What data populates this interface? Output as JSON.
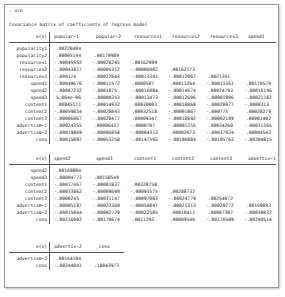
{
  "console": {
    "command": ". vce",
    "title": "Covariance matrix of coefficients of regress model"
  },
  "blocks": [
    {
      "corner": "e(V)",
      "columns": [
        "popular~1",
        "popular~2",
        "resources1",
        "resources2",
        "resources3",
        "spend1"
      ],
      "rows": [
        {
          "label": "popularity1",
          "values": [
            ".00220484",
            "",
            "",
            "",
            "",
            ""
          ]
        },
        {
          "label": "popularity2",
          "values": [
            ".00005144",
            ".00170989",
            "",
            "",
            "",
            ""
          ]
        },
        {
          "label": "resources1",
          "values": [
            "-.00045552",
            "-.00028245",
            ".00162999",
            "",
            "",
            ""
          ]
        },
        {
          "label": "resources2",
          "values": [
            "-.00043817",
            "-.00005312",
            "-.00006082",
            ".00162173",
            "",
            ""
          ]
        },
        {
          "label": "resources3",
          "values": [
            "-.000174",
            "-.00022643",
            "-.00013341",
            "-.00012067",
            ".0021351",
            ""
          ]
        },
        {
          "label": "spend1",
          "values": [
            "-.00049676",
            "-.00011572",
            ".0000587",
            ".00013264",
            "-.00013361",
            ".00170579"
          ]
        },
        {
          "label": "spend2",
          "values": [
            "-.00007232",
            "-.0001875",
            "-.00016084",
            "-.00014674",
            ".00024793",
            "-.00016196"
          ]
        },
        {
          "label": "spend3",
          "values": [
            "5.064e-06",
            "-.00000353",
            "-.00013473",
            "-.00012606",
            "-.00001906",
            "-.00021782"
          ]
        },
        {
          "label": "content1",
          "values": [
            ".00045171",
            "-.00014932",
            ".00030003",
            "-.00018068",
            "-.00020977",
            "-.0000313"
          ]
        },
        {
          "label": "content2",
          "values": [
            "-.00059834",
            "-.00028043",
            ".00032518",
            "-.00001867",
            "-.000775",
            ".00028279"
          ]
        },
        {
          "label": "content3",
          "values": [
            "-.00006867",
            "-.00028477",
            ".00009347",
            "-.00018692",
            "-.00002109",
            ".00001402"
          ]
        },
        {
          "label": "advertism~1",
          "values": [
            "-.00024355",
            ".00006437",
            "-.0000707",
            "-.00001255",
            ".00034268",
            "-.00011365"
          ]
        },
        {
          "label": "advertism~2",
          "values": [
            "-.00019869",
            "-.00006858",
            "-.00004313",
            ".00002673",
            "-.00037924",
            ".00004543"
          ]
        },
        {
          "label": "_cons",
          "values": [
            "-.00015897",
            "-.00053258",
            "-.00147593",
            "-.00196884",
            "-.00195763",
            "-.00204815"
          ]
        }
      ]
    },
    {
      "corner": "e(V)",
      "columns": [
        "spend2",
        "spend3",
        "content1",
        "content2",
        "content3",
        "advertis~1"
      ],
      "rows": [
        {
          "label": "spend2",
          "values": [
            ".00169884",
            "",
            "",
            "",
            "",
            ""
          ]
        },
        {
          "label": "spend3",
          "values": [
            "-.00004773",
            ".00158549",
            "",
            "",
            "",
            ""
          ]
        },
        {
          "label": "content1",
          "values": [
            "-.00017467",
            "-.00001837",
            ".00328758",
            "",
            "",
            ""
          ]
        },
        {
          "label": "content2",
          "values": [
            "-.00033862",
            "-.00009699",
            "-.00093575",
            ".00288732",
            "",
            ""
          ]
        },
        {
          "label": "content3",
          "values": [
            "-.0000245",
            "-.00031147",
            "-.00097083",
            "-.00024779",
            ".00254072",
            ""
          ]
        },
        {
          "label": "advertism~1",
          "values": [
            "-.00005187",
            "-.00023369",
            "-.00054847",
            "-.00021313",
            "-.00028272",
            ".00169893"
          ]
        },
        {
          "label": "advertism~2",
          "values": [
            "-.00015044",
            "-.00002729",
            "-.00022585",
            ".00018411",
            ".00007387",
            "-.00030032"
          ]
        },
        {
          "label": "_cons",
          "values": [
            "-.00216002",
            "-.00170674",
            ".0011293",
            ".00009546",
            "-.00176589",
            "-.00249514"
          ]
        }
      ]
    },
    {
      "corner": "e(V)",
      "columns": [
        "advertis~2",
        "_cons"
      ],
      "rows": [
        {
          "label": "advertism~2",
          "values": [
            ".00164194",
            ""
          ]
        },
        {
          "label": "_cons",
          "values": [
            "-.00244041",
            ".10043973"
          ]
        }
      ]
    }
  ]
}
